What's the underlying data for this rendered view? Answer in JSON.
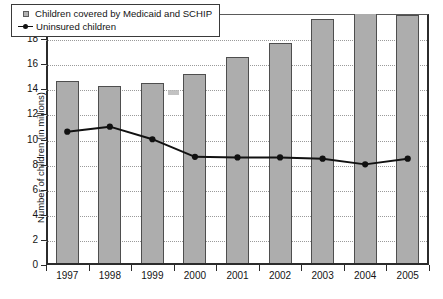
{
  "chart_data": {
    "type": "bar",
    "title": "",
    "xlabel": "",
    "ylabel": "Number of children (in millions)",
    "categories": [
      "1997",
      "1998",
      "1999",
      "2000",
      "2001",
      "2002",
      "2003",
      "2004",
      "2005"
    ],
    "ylim": [
      0,
      20
    ],
    "y_ticks": [
      "0",
      "2",
      "4",
      "6",
      "8",
      "10",
      "12",
      "14",
      "16",
      "18",
      "20"
    ],
    "y_tick_values": [
      0,
      2,
      4,
      6,
      8,
      10,
      12,
      14,
      16,
      18,
      20
    ],
    "grid": true,
    "grid_axis": "y",
    "legend_position": "top-left",
    "series": [
      {
        "name": "Children covered by Medicaid and SCHIP",
        "type": "bar",
        "color": "#adadad",
        "edge_color": "#4e4e4e",
        "marker": "square",
        "values": [
          14.7,
          14.3,
          14.5,
          15.2,
          16.6,
          17.7,
          19.6,
          20.0,
          19.9
        ]
      },
      {
        "name": "Uninsured children",
        "type": "line",
        "color": "#111111",
        "marker": "circle",
        "values": [
          10.7,
          11.1,
          10.1,
          8.7,
          8.65,
          8.65,
          8.55,
          8.1,
          8.55
        ]
      }
    ],
    "annotations": [
      {
        "name": "scan-artifact-smudge",
        "x": 1999.6,
        "y": 13.7
      }
    ]
  },
  "legend": {
    "items": [
      {
        "label": "Children covered by Medicaid and SCHIP",
        "marker": "square-swatch"
      },
      {
        "label": "Uninsured children",
        "marker": "line-with-dot"
      }
    ]
  },
  "caption": {
    "bottom_sliver": "cropped caption text"
  }
}
